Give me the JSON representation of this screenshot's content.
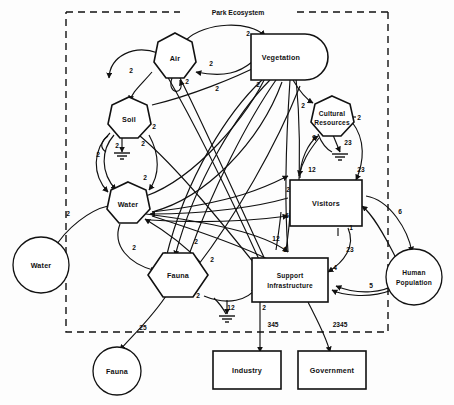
{
  "diagram": {
    "title": "Park Ecosystem",
    "boundary_label": "Park Ecosystem",
    "type": "systems-interaction-diagram",
    "colors": {
      "stroke": "#111111",
      "fill": "#ffffff",
      "background": "#ffffff"
    },
    "nodes": [
      {
        "id": "air",
        "label": "Air",
        "shape": "heptagon",
        "inside_boundary": true,
        "x": 175,
        "y": 58
      },
      {
        "id": "vegetation",
        "label": "Vegetation",
        "shape": "d-shape",
        "inside_boundary": true,
        "x": 287,
        "y": 58
      },
      {
        "id": "soil",
        "label": "Soil",
        "shape": "heptagon",
        "inside_boundary": true,
        "x": 129,
        "y": 119
      },
      {
        "id": "cultural",
        "label": "Cultural Resources",
        "shape": "heptagon",
        "inside_boundary": true,
        "x": 332,
        "y": 117
      },
      {
        "id": "water_in",
        "label": "Water",
        "shape": "heptagon",
        "inside_boundary": true,
        "x": 128,
        "y": 204
      },
      {
        "id": "visitors",
        "label": "Visitors",
        "shape": "rect",
        "inside_boundary": true,
        "x": 325,
        "y": 202
      },
      {
        "id": "fauna_in",
        "label": "Fauna",
        "shape": "hexagon",
        "inside_boundary": true,
        "x": 178,
        "y": 275
      },
      {
        "id": "support",
        "label": "Support Infrastructure",
        "shape": "rect",
        "inside_boundary": true,
        "x": 290,
        "y": 281
      },
      {
        "id": "water_ext",
        "label": "Water",
        "shape": "circle",
        "inside_boundary": false,
        "x": 41,
        "y": 265
      },
      {
        "id": "fauna_ext",
        "label": "Fauna",
        "shape": "circle",
        "inside_boundary": false,
        "x": 117,
        "y": 371
      },
      {
        "id": "human",
        "label": "Human Population",
        "shape": "circle",
        "inside_boundary": false,
        "x": 414,
        "y": 277
      },
      {
        "id": "industry",
        "label": "Industry",
        "shape": "rect",
        "inside_boundary": false,
        "x": 247,
        "y": 370
      },
      {
        "id": "government",
        "label": "Government",
        "shape": "rect",
        "inside_boundary": false,
        "x": 330,
        "y": 370
      }
    ],
    "node_labels": {
      "air": "Air",
      "vegetation": "Vegetation",
      "soil": "Soil",
      "cultural_line1": "Cultural",
      "cultural_line2": "Resources",
      "water_in": "Water",
      "visitors": "Visitors",
      "fauna_in": "Fauna",
      "support_line1": "Support",
      "support_line2": "Infrastructure",
      "water_ext": "Water",
      "fauna_ext": "Fauna",
      "human_line1": "Human",
      "human_line2": "Population",
      "industry": "Industry",
      "government": "Government"
    },
    "edge_labels": [
      {
        "id": "e-air-veg",
        "text": "2",
        "from": "air",
        "to": "vegetation",
        "x": 248,
        "y": 36
      },
      {
        "id": "e-veg-air",
        "text": "2",
        "from": "vegetation",
        "to": "air",
        "x": 211,
        "y": 66
      },
      {
        "id": "e-air-self",
        "text": "2",
        "from": "air",
        "to": "air",
        "x": 187,
        "y": 84
      },
      {
        "id": "e-air-soil",
        "text": "2",
        "from": "air",
        "to": "soil",
        "x": 131,
        "y": 73
      },
      {
        "id": "e-cross-mid",
        "text": "2",
        "from": "soil",
        "to": "vegetation",
        "x": 217,
        "y": 91
      },
      {
        "id": "e-veg-down",
        "text": "2",
        "from": "vegetation",
        "to": "fauna",
        "x": 258,
        "y": 87
      },
      {
        "id": "e-soil-a",
        "text": "2",
        "from": "soil",
        "to": "water",
        "x": 154,
        "y": 129
      },
      {
        "id": "e-soil-b",
        "text": "2",
        "from": "soil",
        "to": "water",
        "x": 143,
        "y": 146
      },
      {
        "id": "e-soil-gnd",
        "text": "2",
        "from": "soil",
        "to": "ground",
        "x": 117,
        "y": 148
      },
      {
        "id": "e-soil-gnd2",
        "text": "2",
        "from": "soil",
        "to": "ground",
        "x": 98,
        "y": 157
      },
      {
        "id": "e-water-in",
        "text": "2",
        "from": "water-ext",
        "to": "water",
        "x": 68,
        "y": 216
      },
      {
        "id": "e-water-up",
        "text": "2",
        "from": "water",
        "to": "soil",
        "x": 145,
        "y": 180
      },
      {
        "id": "e-water-fauna",
        "text": "2",
        "from": "water",
        "to": "fauna",
        "x": 134,
        "y": 250
      },
      {
        "id": "e-fauna-in",
        "text": "2",
        "from": "fauna",
        "to": "water",
        "x": 196,
        "y": 244
      },
      {
        "id": "e-fauna-left",
        "text": "2",
        "from": "vegetation",
        "to": "fauna",
        "x": 212,
        "y": 262
      },
      {
        "id": "e-fauna-bot",
        "text": "2",
        "from": "fauna",
        "to": "support",
        "x": 198,
        "y": 298
      },
      {
        "id": "e-fauna-ext",
        "text": "25",
        "from": "fauna",
        "to": "fauna-ext",
        "x": 143,
        "y": 330
      },
      {
        "id": "e-cult-in",
        "text": "2",
        "from": "vegetation",
        "to": "cultural",
        "x": 303,
        "y": 108
      },
      {
        "id": "e-cult-right",
        "text": "2",
        "from": "cultural",
        "to": "visitors",
        "x": 359,
        "y": 120
      },
      {
        "id": "e-cult-low",
        "text": "2",
        "from": "visitors",
        "to": "cultural",
        "x": 314,
        "y": 140
      },
      {
        "id": "e-cult-gnd",
        "text": "23",
        "from": "cultural",
        "to": "ground",
        "x": 348,
        "y": 145
      },
      {
        "id": "e-vis-12",
        "text": "12",
        "from": "cultural",
        "to": "visitors",
        "x": 312,
        "y": 172
      },
      {
        "id": "e-vis-23",
        "text": "23",
        "from": "cultural",
        "to": "visitors",
        "x": 361,
        "y": 172
      },
      {
        "id": "e-vis-left2",
        "text": "2",
        "from": "support",
        "to": "visitors",
        "x": 288,
        "y": 192
      },
      {
        "id": "e-vis-left6",
        "text": "6",
        "from": "water",
        "to": "visitors",
        "x": 287,
        "y": 218
      },
      {
        "id": "e-vis-1",
        "text": "1",
        "from": "visitors",
        "to": "support",
        "x": 351,
        "y": 230
      },
      {
        "id": "e-vis-23b",
        "text": "23",
        "from": "visitors",
        "to": "support",
        "x": 350,
        "y": 252
      },
      {
        "id": "e-vis-4",
        "text": "4",
        "from": "visitors",
        "to": "support",
        "x": 335,
        "y": 270
      },
      {
        "id": "e-sup-12",
        "text": "12",
        "from": "support",
        "to": "fauna",
        "x": 276,
        "y": 241
      },
      {
        "id": "e-sup-3",
        "text": "3",
        "from": "support",
        "to": "air",
        "x": 285,
        "y": 252
      },
      {
        "id": "e-sup-gnd",
        "text": "12",
        "from": "support",
        "to": "ground",
        "x": 231,
        "y": 310
      },
      {
        "id": "e-sup-2",
        "text": "2",
        "from": "support",
        "to": "industry",
        "x": 264,
        "y": 310
      },
      {
        "id": "e-ind",
        "text": "345",
        "from": "support",
        "to": "industry",
        "x": 273,
        "y": 327
      },
      {
        "id": "e-gov",
        "text": "2345",
        "from": "support",
        "to": "government",
        "x": 340,
        "y": 327
      },
      {
        "id": "e-human-in",
        "text": "6",
        "from": "visitors",
        "to": "human",
        "x": 400,
        "y": 214
      },
      {
        "id": "e-human-out",
        "text": "5",
        "from": "human",
        "to": "support",
        "x": 371,
        "y": 288
      }
    ]
  }
}
